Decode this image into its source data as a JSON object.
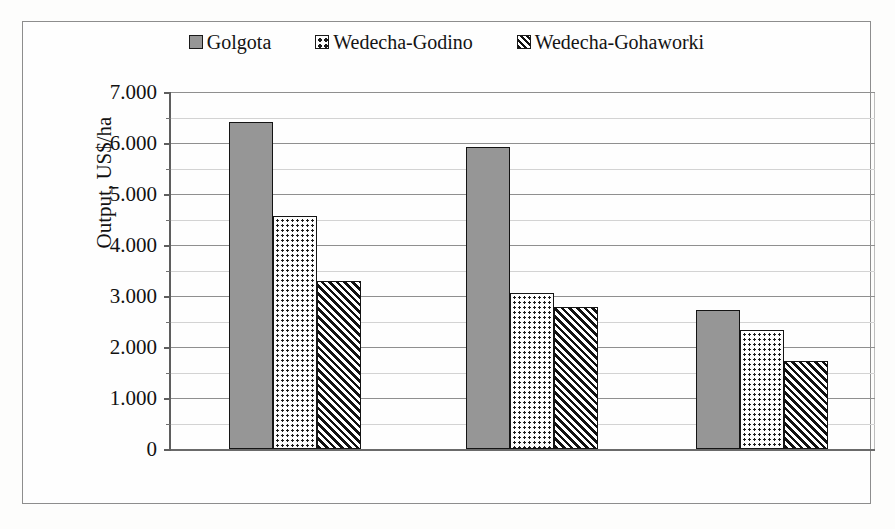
{
  "chart_data": {
    "type": "bar",
    "title": "",
    "xlabel": "",
    "ylabel": "Output, US$/ha",
    "ylim": [
      0,
      7000
    ],
    "ytick_labels": [
      "0",
      "1.000",
      "2.000",
      "3.000",
      "4.000",
      "5.000",
      "6.000",
      "7.000"
    ],
    "ytick_values": [
      0,
      1000,
      2000,
      3000,
      4000,
      5000,
      6000,
      7000
    ],
    "minor_tick_step": 500,
    "grid": true,
    "legend_position": "top-center",
    "categories": [
      "Group 1",
      "Group 2",
      "Group 3"
    ],
    "series": [
      {
        "name": "Golgota",
        "pattern": "solid-gray",
        "color": "#969696",
        "values": [
          6420,
          5920,
          2720
        ]
      },
      {
        "name": "Wedecha-Godino",
        "pattern": "dotted",
        "color": "#fdfdfd",
        "values": [
          4560,
          3050,
          2340
        ]
      },
      {
        "name": "Wedecha-Gohaworki",
        "pattern": "diagonal-hatch",
        "color": "#fbfbfb",
        "values": [
          3300,
          2790,
          1720
        ]
      }
    ]
  },
  "legend": {
    "entries": [
      {
        "label": "Golgota",
        "swatch": "solid-gray-square-icon"
      },
      {
        "label": "Wedecha-Godino",
        "swatch": "dotted-square-icon"
      },
      {
        "label": "Wedecha-Gohaworki",
        "swatch": "hatched-square-icon"
      }
    ]
  },
  "axis": {
    "y_title": "Output, US$/ha",
    "y_labels": [
      "7.000",
      "6.000",
      "5.000",
      "4.000",
      "3.000",
      "2.000",
      "1.000",
      "0"
    ]
  },
  "colors": {
    "series_1_fill": "#969696",
    "bar_outline": "#141414",
    "gridline_major": "#8f8f8f",
    "gridline_minor": "#d3d3d3",
    "axis_line": "#5e5e5e",
    "frame_border": "#8d8d8d",
    "page_background": "#fdfdfc"
  }
}
